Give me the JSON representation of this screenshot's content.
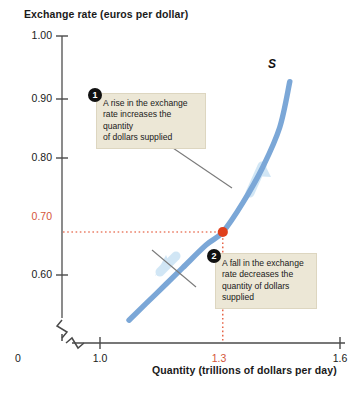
{
  "chart_data": {
    "type": "line",
    "title": "",
    "ylabel": "Exchange rate (euros per dollar)",
    "xlabel": "Quantity (trillions of dollars per day)",
    "ylim": [
      0.55,
      1.0
    ],
    "xlim": [
      0.85,
      1.65
    ],
    "yticks": [
      "1.00",
      "0.90",
      "0.80",
      "0.70",
      "0.60"
    ],
    "ytick_values": [
      1.0,
      0.9,
      0.8,
      0.7,
      0.6
    ],
    "xticks": [
      "0",
      "1.0",
      "1.3",
      "1.6"
    ],
    "xtick_values": [
      1.0,
      1.3,
      1.6
    ],
    "grid": false,
    "legend": "none",
    "axis_break": true,
    "series": [
      {
        "name": "S",
        "label": "S",
        "color": "#7ba7d7",
        "points": [
          {
            "x": 1.02,
            "y": 0.565
          },
          {
            "x": 1.1,
            "y": 0.605
          },
          {
            "x": 1.18,
            "y": 0.645
          },
          {
            "x": 1.25,
            "y": 0.68
          },
          {
            "x": 1.3,
            "y": 0.7
          },
          {
            "x": 1.36,
            "y": 0.745
          },
          {
            "x": 1.42,
            "y": 0.8
          },
          {
            "x": 1.47,
            "y": 0.86
          },
          {
            "x": 1.5,
            "y": 0.93
          }
        ]
      }
    ],
    "equilibrium": {
      "x": 1.3,
      "y": 0.7,
      "x_label": "1.3",
      "y_label": "0.70",
      "color": "#e0401c"
    },
    "arrows": [
      {
        "name": "increase-arrow",
        "direction": "up-along-curve"
      },
      {
        "name": "decrease-arrow",
        "direction": "down-along-curve"
      }
    ],
    "annotations": [
      {
        "number": "1",
        "text": "A rise in the exchange rate increases the quantity of dollars supplied",
        "lines": [
          "A rise in the exchange",
          "rate increases the quantity",
          "of dollars supplied"
        ]
      },
      {
        "number": "2",
        "text": "A fall in the exchange rate decreases the quantity of dollars supplied",
        "lines": [
          "A fall in the exchange",
          "rate decreases the",
          "quantity of dollars",
          "supplied"
        ]
      }
    ]
  },
  "axes": {
    "y_title": "Exchange rate (euros per dollar)",
    "x_title": "Quantity (trillions of dollars per day)",
    "y_ticks": {
      "t100": "1.00",
      "t090": "0.90",
      "t080": "0.80",
      "t070": "0.70",
      "t060": "0.60"
    },
    "x_ticks": {
      "origin": "0",
      "t10": "1.0",
      "t13": "1.3",
      "t16": "1.6"
    }
  },
  "curve": {
    "label": "S"
  },
  "callouts": {
    "one": {
      "badge": "1",
      "line1": "A rise in the exchange",
      "line2": "rate increases the quantity",
      "line3": "of dollars supplied"
    },
    "two": {
      "badge": "2",
      "line1": "A fall in the exchange",
      "line2": "rate decreases the",
      "line3": "quantity of dollars",
      "line4": "supplied"
    }
  },
  "colors": {
    "curve": "#7ba7d7",
    "highlight": "#d4553a",
    "point": "#e0401c",
    "callout_bg": "#ece7d6",
    "axis": "#5a5a5a"
  }
}
